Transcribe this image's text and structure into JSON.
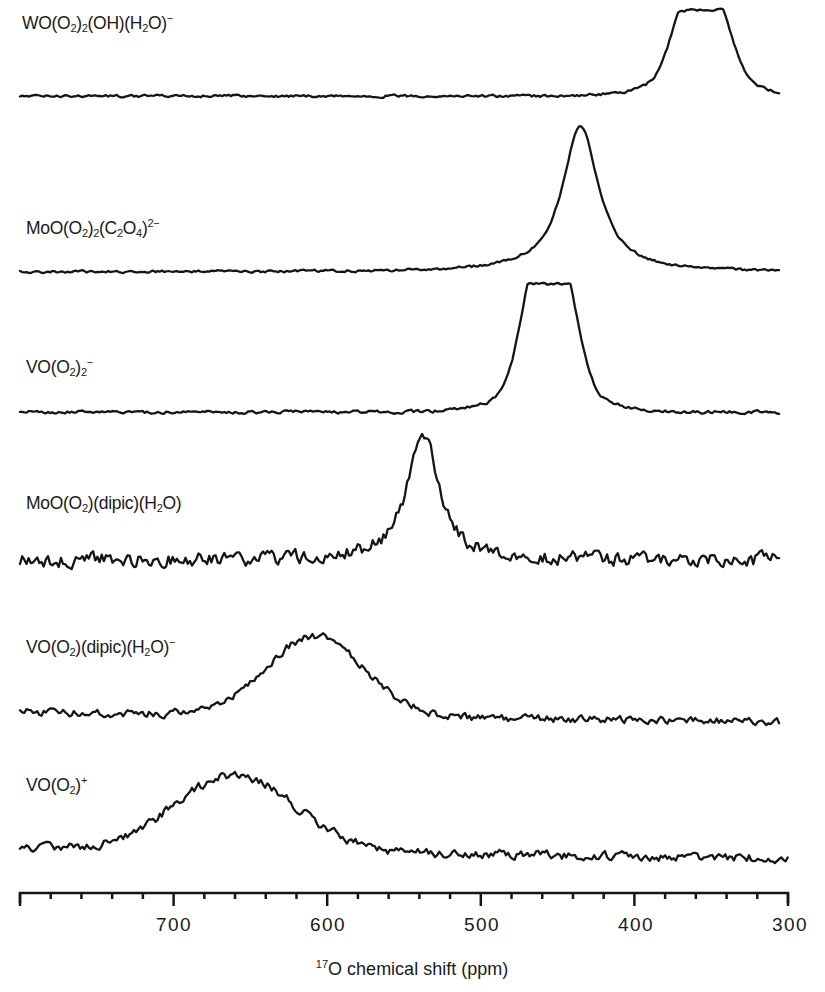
{
  "chart_data": {
    "type": "line",
    "title": "",
    "xlabel": "17O chemical shift (ppm)",
    "xlabel_parts": {
      "sup": "17",
      "rest": "O chemical shift (ppm)"
    },
    "ylabel": "",
    "xlim": [
      800,
      300
    ],
    "x_reversed": true,
    "x_ticks": [
      700,
      600,
      500,
      400,
      300
    ],
    "x_tick_labels": [
      "700",
      "600",
      "500",
      "400",
      "300"
    ],
    "minor_tick_step": 20,
    "grid": false,
    "legend": "none (per-trace text labels)",
    "stacked_offset": true,
    "series": [
      {
        "name": "WO(O2)2(OH)(H2O)-",
        "label_html": "WO(O<sub>2</sub>)<sub>2</sub>(OH)(H<sub>2</sub>O)<sup>&minus;</sup>",
        "peaks_ppm": [
          365,
          348
        ],
        "peak_shape": "doublet",
        "baseline_y": 96,
        "peak_y": 12,
        "noise": 2,
        "width_ppm": 28,
        "x_end_ppm": 305
      },
      {
        "name": "MoO(O2)2(C2O4)2-",
        "label_html": "MoO(O<sub>2</sub>)<sub>2</sub>(C<sub>2</sub>O<sub>4</sub>)<sup>2&minus;</sup>",
        "peaks_ppm": [
          435
        ],
        "peak_shape": "singlet",
        "baseline_y": 272,
        "peak_y": 125,
        "noise": 2,
        "width_ppm": 14,
        "x_end_ppm": 305
      },
      {
        "name": "VO(O2)2-",
        "label_html": "VO(O<sub>2</sub>)<sub>2</sub><sup>&minus;</sup>",
        "peaks_ppm": [
          464,
          447
        ],
        "peak_shape": "doublet",
        "baseline_y": 412,
        "peak_y": 286,
        "noise": 2.5,
        "width_ppm": 26,
        "x_end_ppm": 305
      },
      {
        "name": "MoO(O2)(dipic)(H2O)",
        "label_html": "MoO(O<sub>2</sub>)(dipic)(H<sub>2</sub>O)",
        "peaks_ppm": [
          538
        ],
        "peak_shape": "singlet",
        "baseline_y": 560,
        "peak_y": 430,
        "noise": 11,
        "width_ppm": 12,
        "x_end_ppm": 305
      },
      {
        "name": "VO(O2)(dipic)(H2O)-",
        "label_html": "VO(O<sub>2</sub>)(dipic)(H<sub>2</sub>O)<sup>&minus;</sup>",
        "peaks_ppm": [
          608
        ],
        "peak_shape": "broad",
        "baseline_y": 712,
        "peak_y": 632,
        "noise": 6,
        "width_ppm": 45,
        "x_end_ppm": 305
      },
      {
        "name": "VO(O2)+",
        "label_html": "VO(O<sub>2</sub>)<sup>+</sup>",
        "peaks_ppm": [
          660
        ],
        "peak_shape": "broad",
        "baseline_y": 848,
        "peak_y": 772,
        "noise": 7,
        "width_ppm": 55,
        "x_end_ppm": 300
      }
    ]
  },
  "labels": [
    {
      "text": "WO(O2)2(OH)(H2O)−",
      "x": 22,
      "y": 12
    },
    {
      "text": "MoO(O2)2(C2O4)2−",
      "x": 26,
      "y": 217
    },
    {
      "text": "VO(O2)2−",
      "x": 26,
      "y": 356
    },
    {
      "text": "MoO(O2)(dipic)(H2O)",
      "x": 26,
      "y": 493
    },
    {
      "text": "VO(O2)(dipic)(H2O)−",
      "x": 26,
      "y": 636
    },
    {
      "text": "VO(O2)+",
      "x": 26,
      "y": 774
    }
  ],
  "axis": {
    "tick_labels": [
      "700",
      "600",
      "500",
      "400",
      "300"
    ],
    "xlabel_sup": "17",
    "xlabel_rest": "O chemical shift (ppm)"
  }
}
